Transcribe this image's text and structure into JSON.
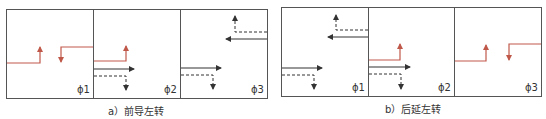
{
  "colors": {
    "frame": "#555555",
    "through": "#333333",
    "left_turn": "#c0584a",
    "text": "#333333"
  },
  "figures": [
    {
      "id": "a",
      "caption": "a）前导左转",
      "phases": [
        {
          "label": "ϕ1",
          "movements": [
            "left-turn-eastbound",
            "left-turn-westbound"
          ]
        },
        {
          "label": "ϕ2",
          "movements": [
            "left-turn-eastbound",
            "through-eastbound",
            "right-turn-eastbound"
          ]
        },
        {
          "label": "ϕ3",
          "movements": [
            "through-eastbound",
            "right-turn-eastbound",
            "through-westbound",
            "right-turn-westbound"
          ]
        }
      ]
    },
    {
      "id": "b",
      "caption": "b）后延左转",
      "phases": [
        {
          "label": "ϕ1",
          "movements": [
            "through-eastbound",
            "right-turn-eastbound",
            "through-westbound",
            "right-turn-westbound"
          ]
        },
        {
          "label": "ϕ2",
          "movements": [
            "left-turn-eastbound",
            "through-eastbound",
            "right-turn-eastbound"
          ]
        },
        {
          "label": "ϕ3",
          "movements": [
            "left-turn-eastbound",
            "left-turn-westbound"
          ]
        }
      ]
    }
  ]
}
